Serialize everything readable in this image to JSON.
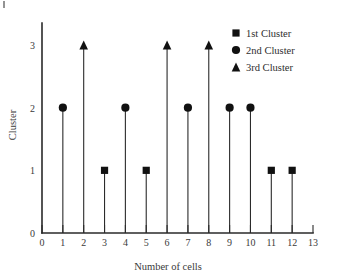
{
  "chart_data": {
    "type": "scatter",
    "title": "",
    "xlabel": "Number of cells",
    "ylabel": "Cluster",
    "xlim": [
      0,
      13
    ],
    "ylim": [
      0,
      3
    ],
    "grid": false,
    "legend_position": "top-right",
    "xticks": [
      "0",
      "1",
      "2",
      "3",
      "4",
      "5",
      "6",
      "7",
      "8",
      "9",
      "10",
      "11",
      "12",
      "13"
    ],
    "yticks": [
      "0",
      "1",
      "2",
      "3"
    ],
    "x": [
      1,
      2,
      3,
      4,
      5,
      6,
      7,
      8,
      9,
      10,
      11,
      12
    ],
    "values": [
      2,
      3,
      1,
      2,
      1,
      3,
      2,
      3,
      2,
      2,
      1,
      1
    ],
    "markers": [
      "circle",
      "triangle",
      "square",
      "circle",
      "square",
      "triangle",
      "circle",
      "triangle",
      "circle",
      "circle",
      "square",
      "square"
    ],
    "series": [
      {
        "name": "1st Cluster",
        "marker": "square",
        "color": "#111111",
        "x": [
          3,
          5,
          11,
          12
        ],
        "values": [
          1,
          1,
          1,
          1
        ]
      },
      {
        "name": "2nd Cluster",
        "marker": "circle",
        "color": "#111111",
        "x": [
          1,
          4,
          7,
          9,
          10
        ],
        "values": [
          2,
          2,
          2,
          2,
          2
        ]
      },
      {
        "name": "3rd Cluster",
        "marker": "triangle",
        "color": "#111111",
        "x": [
          2,
          6,
          8
        ],
        "values": [
          3,
          3,
          3
        ]
      }
    ],
    "points": [
      {
        "x": 1,
        "y": 2,
        "marker": "circle",
        "series": "2nd Cluster"
      },
      {
        "x": 2,
        "y": 3,
        "marker": "triangle",
        "series": "3rd Cluster"
      },
      {
        "x": 3,
        "y": 1,
        "marker": "square",
        "series": "1st Cluster"
      },
      {
        "x": 4,
        "y": 2,
        "marker": "circle",
        "series": "2nd Cluster"
      },
      {
        "x": 5,
        "y": 1,
        "marker": "square",
        "series": "1st Cluster"
      },
      {
        "x": 6,
        "y": 3,
        "marker": "triangle",
        "series": "3rd Cluster"
      },
      {
        "x": 7,
        "y": 2,
        "marker": "circle",
        "series": "2nd Cluster"
      },
      {
        "x": 8,
        "y": 3,
        "marker": "triangle",
        "series": "3rd Cluster"
      },
      {
        "x": 9,
        "y": 2,
        "marker": "circle",
        "series": "2nd Cluster"
      },
      {
        "x": 10,
        "y": 2,
        "marker": "circle",
        "series": "2nd Cluster"
      },
      {
        "x": 11,
        "y": 1,
        "marker": "square",
        "series": "1st Cluster"
      },
      {
        "x": 12,
        "y": 1,
        "marker": "square",
        "series": "1st Cluster"
      }
    ],
    "legend": [
      {
        "label": "1st Cluster",
        "marker": "square"
      },
      {
        "label": "2nd Cluster",
        "marker": "circle"
      },
      {
        "label": "3rd Cluster",
        "marker": "triangle"
      }
    ]
  },
  "colors": {
    "ink": "#2a2a2a",
    "marker": "#111111",
    "background": "#ffffff"
  }
}
